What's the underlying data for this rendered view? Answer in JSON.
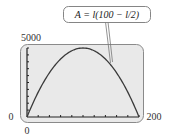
{
  "chart_data": {
    "type": "line",
    "title": "",
    "annotation": "A = l(100 − l/2)",
    "xlabel": "",
    "ylabel": "",
    "xlim": [
      0,
      200
    ],
    "ylim": [
      0,
      5000
    ],
    "x_tick_labels": {
      "min_left": "0",
      "min_below": "0",
      "max": "200"
    },
    "y_tick_labels": {
      "max": "5000"
    },
    "grid": false,
    "legend": null,
    "series": [
      {
        "name": "A = l(100 − l/2)",
        "x": [
          0,
          20,
          40,
          60,
          80,
          100,
          120,
          140,
          160,
          180,
          200
        ],
        "values": [
          0,
          1800,
          3200,
          4200,
          4800,
          5000,
          4800,
          4200,
          3200,
          1800,
          0
        ]
      }
    ],
    "x_ticks_count": 10,
    "y_ticks_count": 10
  },
  "labels": {
    "equation": "A = l(100 − l/2)",
    "y_max": "5000",
    "x_min_left": "0",
    "x_min_below": "0",
    "x_max": "200"
  },
  "colors": {
    "plot_background": "#e9e9e9",
    "frame": "#8a8a8a",
    "curve": "#3a3a3a",
    "axis": "#222222",
    "text": "#333333"
  }
}
